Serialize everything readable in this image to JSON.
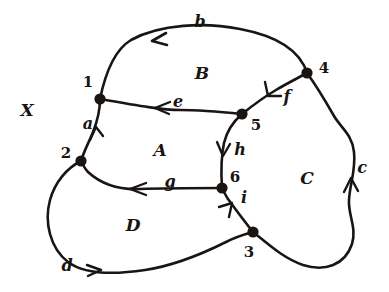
{
  "figure": {
    "ink_color": "#1a1512",
    "background_color": "#ffffff",
    "width": 389,
    "height": 292,
    "space_label": {
      "text": "X",
      "x": 27,
      "y": 110
    }
  },
  "regions": [
    {
      "id": "A",
      "label": "A",
      "x": 160,
      "y": 150
    },
    {
      "id": "B",
      "label": "B",
      "x": 202,
      "y": 73
    },
    {
      "id": "C",
      "label": "C",
      "x": 307,
      "y": 178
    },
    {
      "id": "D",
      "label": "D",
      "x": 133,
      "y": 225
    }
  ],
  "vertices": [
    {
      "id": "1",
      "label": "1",
      "x": 100,
      "y": 99,
      "label_x": 88,
      "label_y": 82
    },
    {
      "id": "2",
      "label": "2",
      "x": 81,
      "y": 161,
      "label_x": 66,
      "label_y": 153
    },
    {
      "id": "3",
      "label": "3",
      "x": 253,
      "y": 232,
      "label_x": 249,
      "label_y": 252
    },
    {
      "id": "4",
      "label": "4",
      "x": 307,
      "y": 73,
      "label_x": 324,
      "label_y": 68
    },
    {
      "id": "5",
      "label": "5",
      "x": 242,
      "y": 114,
      "label_x": 256,
      "label_y": 125
    },
    {
      "id": "6",
      "label": "6",
      "x": 222,
      "y": 188,
      "label_x": 235,
      "label_y": 177
    }
  ],
  "edges": [
    {
      "id": "a",
      "label": "a",
      "from": "1",
      "to": "2",
      "label_x": 88,
      "label_y": 124,
      "arrow": "down"
    },
    {
      "id": "b",
      "label": "b",
      "from": "4",
      "to": "1",
      "label_x": 200,
      "label_y": 22,
      "arrow": "left"
    },
    {
      "id": "c",
      "label": "c",
      "from": "3",
      "to": "4",
      "label_x": 362,
      "label_y": 168,
      "arrow": "up"
    },
    {
      "id": "d",
      "label": "d",
      "from": "2",
      "to": "3",
      "label_x": 67,
      "label_y": 266,
      "arrow": "right"
    },
    {
      "id": "e",
      "label": "e",
      "from": "5",
      "to": "1",
      "label_x": 178,
      "label_y": 102,
      "arrow": "left"
    },
    {
      "id": "f",
      "label": "f",
      "from": "4",
      "to": "5",
      "label_x": 287,
      "label_y": 97,
      "arrow": "down-left"
    },
    {
      "id": "g",
      "label": "g",
      "from": "6",
      "to": "2",
      "label_x": 170,
      "label_y": 182,
      "arrow": "left"
    },
    {
      "id": "h",
      "label": "h",
      "from": "5",
      "to": "6",
      "label_x": 240,
      "label_y": 150,
      "arrow": "down"
    },
    {
      "id": "i",
      "label": "i",
      "from": "3",
      "to": "6",
      "label_x": 244,
      "label_y": 198,
      "arrow": "up-left"
    }
  ]
}
